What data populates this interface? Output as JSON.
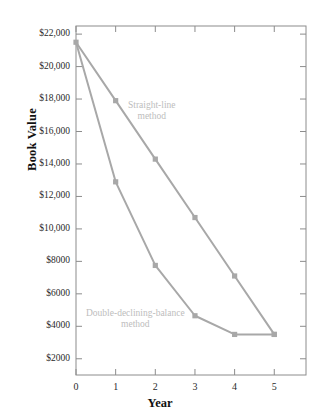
{
  "chart_data": {
    "type": "line",
    "title": "",
    "xlabel": "Year",
    "ylabel": "Book Value",
    "x": [
      0,
      1,
      2,
      3,
      4,
      5
    ],
    "xtick_labels": [
      "0",
      "1",
      "2",
      "3",
      "4",
      "5"
    ],
    "ytick_values": [
      2000,
      4000,
      6000,
      8000,
      10000,
      12000,
      14000,
      16000,
      18000,
      20000,
      22000
    ],
    "ytick_labels": [
      "$2000",
      "$4000",
      "$6000",
      "$8000",
      "$10,000",
      "$12,000",
      "$14,000",
      "$16,000",
      "$18,000",
      "$20,000",
      "$22,000"
    ],
    "xlim": [
      0,
      5.8
    ],
    "ylim": [
      1000,
      22500
    ],
    "grid": false,
    "legend_position": "inline-annotations",
    "line_color": "#a8a8a8",
    "marker_color": "#a8a8a8",
    "annotation_color": "#bdbdbd",
    "axis_color": "#8c8c8c",
    "series": [
      {
        "name": "Straight-line method",
        "annotation_lines": [
          "Straight-line",
          "method"
        ],
        "values": [
          21500,
          17900,
          14300,
          10700,
          7100,
          3500
        ]
      },
      {
        "name": "Double-declining-balance method",
        "annotation_lines": [
          "Double-declining-balance",
          "method"
        ],
        "values": [
          21500,
          12900,
          7750,
          4650,
          3500,
          3500
        ]
      }
    ]
  }
}
